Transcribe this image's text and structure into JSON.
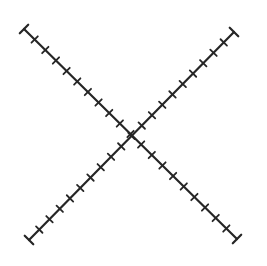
{
  "canvas": {
    "width": 267,
    "height": 266,
    "background": "#ffffff"
  },
  "style": {
    "stroke_color": "#262626",
    "line_width": 2.2,
    "tick_width": 1.8,
    "tick_length": 9,
    "cap_length": 12
  },
  "lines": [
    {
      "name": "diagonal-line-descending",
      "start": [
        24,
        29
      ],
      "end": [
        237,
        239
      ],
      "tick_count": 21
    },
    {
      "name": "diagonal-line-ascending",
      "start": [
        29,
        240
      ],
      "end": [
        234,
        32
      ],
      "tick_count": 21
    }
  ]
}
